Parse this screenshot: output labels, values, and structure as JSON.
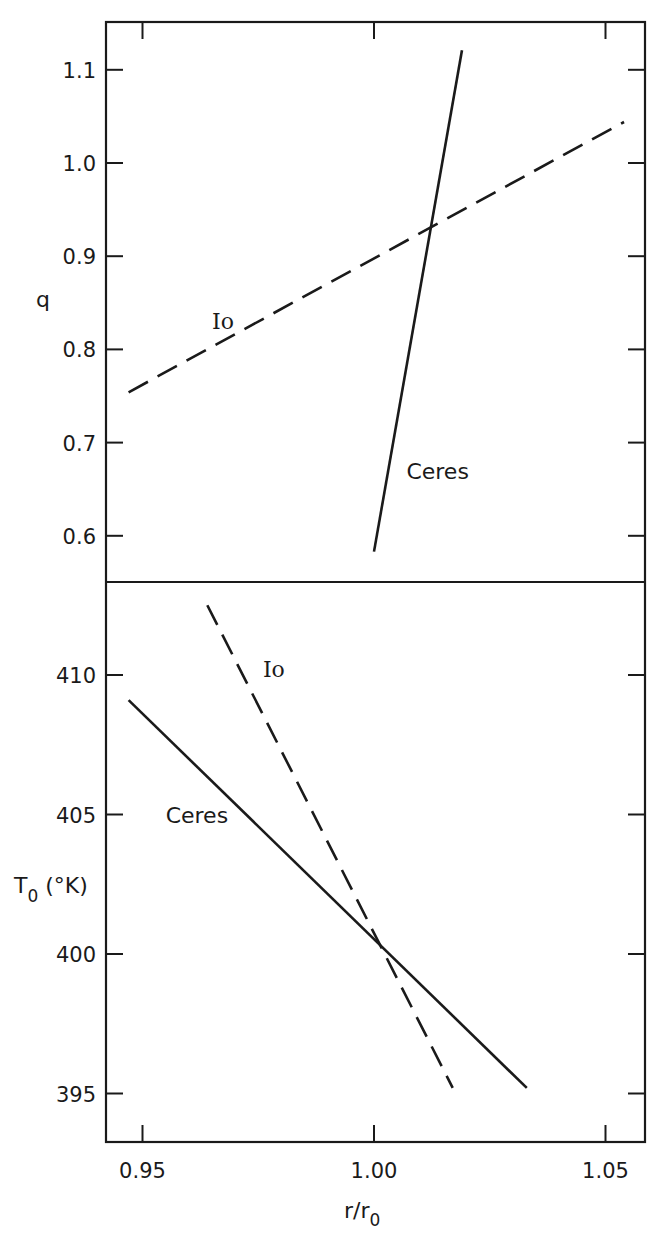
{
  "chart_data": [
    {
      "panel": "top",
      "type": "line",
      "title": "",
      "xlabel": "r/r0",
      "ylabel": "q",
      "xlim": [
        0.94,
        1.06
      ],
      "ylim": [
        0.55,
        1.15
      ],
      "xticks": [
        0.95,
        1.0,
        1.05
      ],
      "xtick_labels": [
        "0.95",
        "1.00",
        "1.05"
      ],
      "yticks": [
        0.6,
        0.7,
        0.8,
        0.9,
        1.0,
        1.1
      ],
      "ytick_labels": [
        "0.6",
        "0.7",
        "0.8",
        "0.9",
        "1.0",
        "1.1"
      ],
      "grid": false,
      "legend": "inline labels",
      "series": [
        {
          "name": "Io",
          "style": "dashed",
          "x": [
            0.947,
            1.054
          ],
          "y": [
            0.754,
            1.044
          ],
          "label_pos": [
            0.965,
            0.83
          ]
        },
        {
          "name": "Ceres",
          "style": "solid",
          "x": [
            1.0,
            1.019
          ],
          "y": [
            0.583,
            1.121
          ],
          "label_pos": [
            1.007,
            0.67
          ]
        }
      ]
    },
    {
      "panel": "bottom",
      "type": "line",
      "title": "",
      "xlabel": "r/r0",
      "ylabel": "T0 (°K)",
      "xlim": [
        0.94,
        1.06
      ],
      "ylim": [
        393.2,
        413.5
      ],
      "xticks": [
        0.95,
        1.0,
        1.05
      ],
      "xtick_labels": [
        "0.95",
        "1.00",
        "1.05"
      ],
      "yticks": [
        395,
        400,
        405,
        410
      ],
      "ytick_labels": [
        "395",
        "400",
        "405",
        "410"
      ],
      "grid": false,
      "legend": "inline labels",
      "series": [
        {
          "name": "Io",
          "style": "dashed",
          "x": [
            0.964,
            1.017
          ],
          "y": [
            412.5,
            395.2
          ],
          "label_pos": [
            0.976,
            410.2
          ]
        },
        {
          "name": "Ceres",
          "style": "solid",
          "x": [
            0.947,
            1.033
          ],
          "y": [
            409.1,
            395.2
          ],
          "label_pos": [
            0.955,
            405.0
          ]
        }
      ]
    }
  ],
  "labels": {
    "top_ylabel": "q",
    "bottom_ylabel_main": "T",
    "bottom_ylabel_sub": "0",
    "bottom_ylabel_unit": " (°K)",
    "xlabel_main": "r/r",
    "xlabel_sub": "0",
    "io": "Io",
    "ceres": "Ceres"
  },
  "layout": {
    "frame": {
      "left": 106,
      "right": 645,
      "top": 22,
      "divider": 582,
      "bottom": 1142
    },
    "x_px_per_unit": 4630,
    "x_ref": {
      "value": 1.0,
      "px": 374
    },
    "top_y": {
      "ref_value": 1.0,
      "ref_px": 163,
      "px_per_unit": 932
    },
    "bottom_y": {
      "ref_value": 400,
      "ref_px": 954,
      "px_per_unit": 27.9
    },
    "colors": {
      "ink": "#1a1a1a",
      "background": "#ffffff"
    }
  }
}
